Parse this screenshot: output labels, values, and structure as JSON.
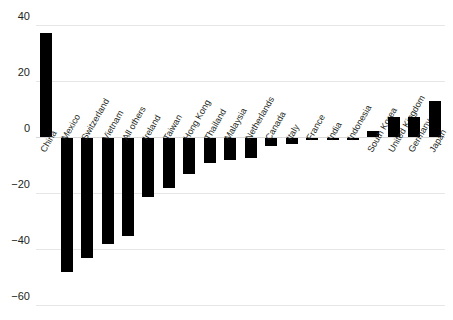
{
  "title": "",
  "chart_data": {
    "type": "bar",
    "title": "",
    "subtitle": "",
    "xlabel": "",
    "ylabel": "",
    "ylim": [
      -60,
      40
    ],
    "yticks": [
      40,
      20,
      0,
      -20,
      -40,
      -60
    ],
    "ytick_labels": [
      "40",
      "20",
      "0",
      "−20",
      "−40",
      "−60"
    ],
    "grid": true,
    "legend": "none",
    "bar_color": "#000000",
    "categories": [
      "China",
      "Mexico",
      "Switzerland",
      "Vietnam",
      "All others",
      "Ireland",
      "Taiwan",
      "Hong Kong",
      "Thailand",
      "Malaysia",
      "Netherlands",
      "Canada",
      "Italy",
      "France",
      "India",
      "Indonesia",
      "South Korea",
      "United Kingdom",
      "Germany",
      "Japan"
    ],
    "values": [
      37,
      -48,
      -43,
      -38,
      -35,
      -21,
      -18,
      -13,
      -9,
      -8,
      -7,
      -3,
      -2,
      -0.6,
      -0.4,
      -0.3,
      2,
      7,
      7,
      13
    ]
  }
}
